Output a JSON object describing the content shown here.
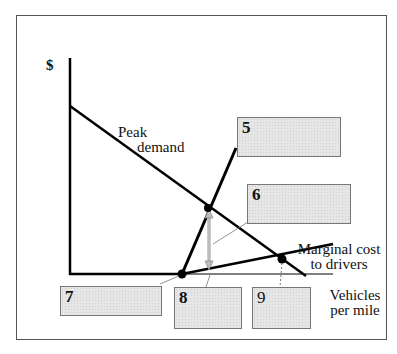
{
  "axes": {
    "y_label": "$",
    "x_label_line1": "Vehicles",
    "x_label_line2": "per mile"
  },
  "curves": {
    "demand_line1": "Peak",
    "demand_line2": "demand",
    "mc_line1": "Marginal cost",
    "mc_line2": "to drivers"
  },
  "boxes": [
    {
      "id": "5",
      "label": "5"
    },
    {
      "id": "6",
      "label": "6"
    },
    {
      "id": "7",
      "label": "7"
    },
    {
      "id": "8",
      "label": "8"
    },
    {
      "id": "9",
      "label": "9"
    }
  ]
}
